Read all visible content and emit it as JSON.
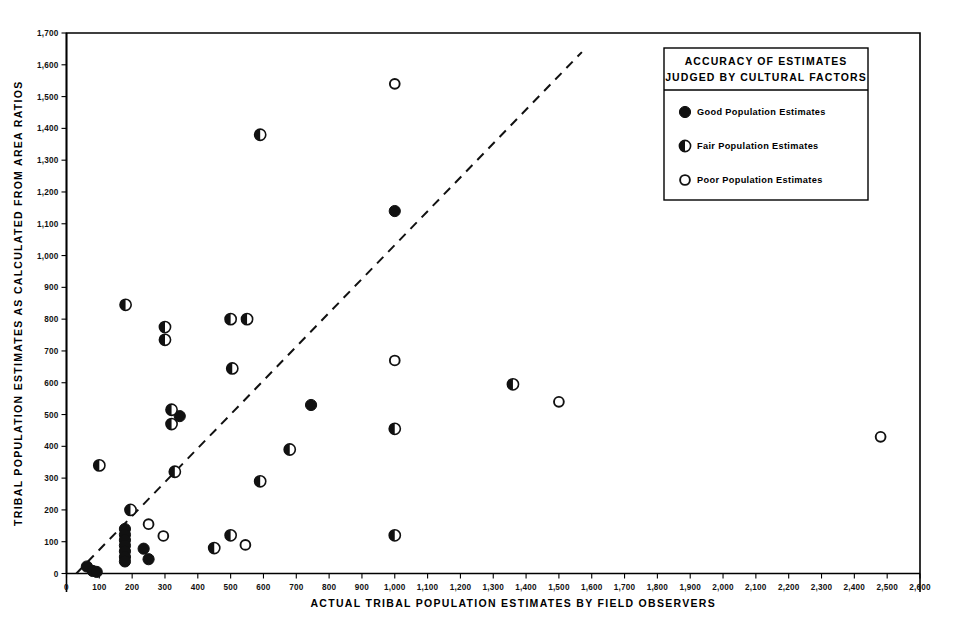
{
  "chart_data": {
    "type": "scatter",
    "title": "",
    "xlabel": "ACTUAL TRIBAL POPULATION ESTIMATES BY FIELD OBSERVERS",
    "ylabel": "TRIBAL POPULATION ESTIMATES AS CALCULATED FROM AREA RATIOS",
    "xlim": [
      0,
      2600
    ],
    "ylim": [
      0,
      1700
    ],
    "xticks": [
      0,
      100,
      200,
      300,
      400,
      500,
      600,
      700,
      800,
      900,
      1000,
      1100,
      1200,
      1300,
      1400,
      1500,
      1600,
      1700,
      1800,
      1900,
      2000,
      2100,
      2200,
      2300,
      2400,
      2500,
      2600
    ],
    "xticklabels": [
      "0",
      "100",
      "200",
      "300",
      "400",
      "500",
      "600",
      "700",
      "800",
      "900",
      "1,000",
      "1,100",
      "1,200",
      "1,300",
      "1,400",
      "1,500",
      "1,600",
      "1,700",
      "1,800",
      "1,900",
      "2,000",
      "2,100",
      "2,200",
      "2,300",
      "2,400",
      "2,500",
      "2,600"
    ],
    "yticks": [
      0,
      100,
      200,
      300,
      400,
      500,
      600,
      700,
      800,
      900,
      1000,
      1100,
      1200,
      1300,
      1400,
      1500,
      1600,
      1700
    ],
    "yticklabels": [
      "0",
      "100",
      "200",
      "300",
      "400",
      "500",
      "600",
      "700",
      "800",
      "900",
      "1,000",
      "1,100",
      "1,200",
      "1,300",
      "1,400",
      "1,500",
      "1,600",
      "1,700"
    ],
    "grid": false,
    "reference_line": {
      "style": "dashed",
      "description": "1:1 agreement line",
      "x0": 30,
      "y0": 0,
      "x1": 1570,
      "y1": 1640
    },
    "legend_position": "top-right",
    "series": [
      {
        "name": "Good Population Estimates",
        "marker": "filled-circle",
        "points": [
          [
            62,
            22
          ],
          [
            80,
            8
          ],
          [
            92,
            5
          ],
          [
            178,
            140
          ],
          [
            178,
            122
          ],
          [
            178,
            105
          ],
          [
            178,
            88
          ],
          [
            178,
            70
          ],
          [
            178,
            52
          ],
          [
            178,
            38
          ],
          [
            235,
            78
          ],
          [
            250,
            45
          ],
          [
            345,
            495
          ],
          [
            745,
            530
          ],
          [
            1000,
            1140
          ]
        ]
      },
      {
        "name": "Fair Population Estimates",
        "marker": "half-filled-circle",
        "points": [
          [
            100,
            340
          ],
          [
            180,
            845
          ],
          [
            195,
            200
          ],
          [
            300,
            775
          ],
          [
            300,
            735
          ],
          [
            320,
            515
          ],
          [
            320,
            470
          ],
          [
            330,
            320
          ],
          [
            450,
            80
          ],
          [
            500,
            800
          ],
          [
            500,
            120
          ],
          [
            505,
            645
          ],
          [
            550,
            800
          ],
          [
            590,
            290
          ],
          [
            590,
            1380
          ],
          [
            680,
            390
          ],
          [
            1000,
            455
          ],
          [
            1000,
            120
          ],
          [
            1360,
            595
          ]
        ]
      },
      {
        "name": "Poor Population Estimates",
        "marker": "open-circle",
        "points": [
          [
            250,
            155
          ],
          [
            295,
            118
          ],
          [
            545,
            90
          ],
          [
            1000,
            1540
          ],
          [
            1000,
            670
          ],
          [
            1500,
            540
          ],
          [
            2480,
            430
          ]
        ]
      }
    ]
  },
  "legend": {
    "title_line1": "ACCURACY OF ESTIMATES",
    "title_line2": "JUDGED BY CULTURAL FACTORS",
    "entries": [
      {
        "label": "Good Population Estimates",
        "marker": "filled-circle"
      },
      {
        "label": "Fair Population Estimates",
        "marker": "half-filled-circle"
      },
      {
        "label": "Poor Population Estimates",
        "marker": "open-circle"
      }
    ]
  }
}
